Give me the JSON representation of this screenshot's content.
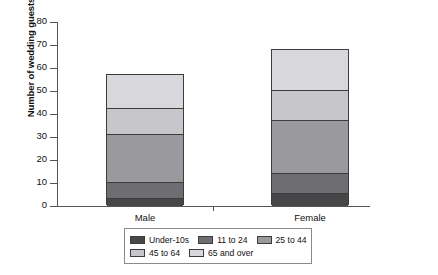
{
  "chart_data": {
    "type": "bar",
    "subtype": "stacked",
    "title": "",
    "xlabel": "",
    "ylabel": "Number of wedding guests",
    "categories": [
      "Male",
      "Female"
    ],
    "ylim": [
      0,
      80
    ],
    "y_ticks": [
      80,
      70,
      60,
      50,
      40,
      30,
      20,
      10,
      0
    ],
    "grid": false,
    "legend_position": "bottom",
    "series": [
      {
        "name": "Under-10s",
        "values": [
          3,
          5
        ],
        "color": "#474749"
      },
      {
        "name": "11 to 24",
        "values": [
          7,
          9
        ],
        "color": "#6e6e72"
      },
      {
        "name": "25 to 44",
        "values": [
          21,
          23
        ],
        "color": "#9a9a9e"
      },
      {
        "name": "45 to 64",
        "values": [
          11,
          13
        ],
        "color": "#c6c6cb"
      },
      {
        "name": "65 and over",
        "values": [
          15,
          18
        ],
        "color": "#d8d8dc"
      }
    ],
    "totals": [
      57,
      68
    ],
    "cumulative_tops": {
      "Male": [
        3,
        10,
        31,
        42,
        57
      ],
      "Female": [
        5,
        14,
        37,
        50,
        68
      ]
    }
  },
  "axis": {
    "y_title": "Number of wedding guests",
    "y_tick_labels": [
      "80",
      "70",
      "60",
      "50",
      "40",
      "30",
      "20",
      "10",
      "0"
    ],
    "x_tick_labels": [
      "Male",
      "Female"
    ]
  },
  "legend": {
    "row1": [
      {
        "label": "Under-10s",
        "color": "#474749"
      },
      {
        "label": "11 to 24",
        "color": "#6e6e72"
      },
      {
        "label": "25 to 44",
        "color": "#9a9a9e"
      }
    ],
    "row2": [
      {
        "label": "45 to 64",
        "color": "#c6c6cb"
      },
      {
        "label": "65 and over",
        "color": "#d8d8dc"
      }
    ]
  }
}
